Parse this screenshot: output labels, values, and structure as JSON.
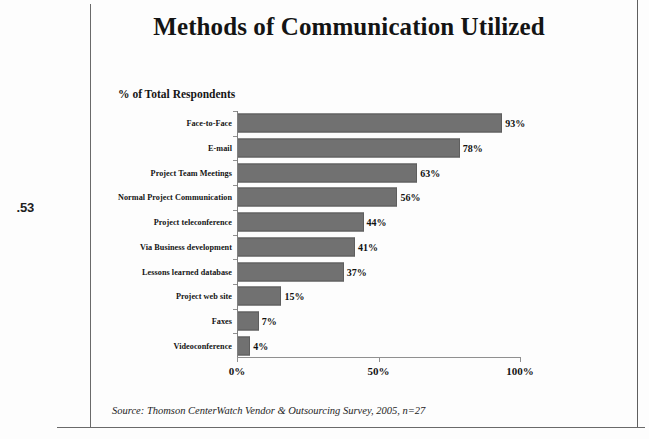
{
  "page": {
    "margin_note": ".53",
    "source_note": "Source: Thomson CenterWatch Vendor & Outsourcing Survey, 2005, n=27"
  },
  "chart_data": {
    "type": "bar",
    "orientation": "horizontal",
    "title": "Methods of Communication Utilized",
    "subtitle": "% of Total Respondents",
    "xlabel": "",
    "ylabel": "",
    "xlim": [
      0,
      100
    ],
    "xticks": [
      "0%",
      "50%",
      "100%"
    ],
    "xtick_values": [
      0,
      50,
      100
    ],
    "grid": false,
    "legend": false,
    "bar_color": "#717171",
    "categories": [
      "Face-to-Face",
      "E-mail",
      "Project Team Meetings",
      "Normal Project Communication",
      "Project teleconference",
      "Via Business development",
      "Lessons learned database",
      "Project web site",
      "Faxes",
      "Videoconference"
    ],
    "values": [
      93,
      78,
      63,
      56,
      44,
      41,
      37,
      15,
      7,
      4
    ],
    "value_labels": [
      "93%",
      "78%",
      "63%",
      "56%",
      "44%",
      "41%",
      "37%",
      "15%",
      "7%",
      "4%"
    ]
  }
}
